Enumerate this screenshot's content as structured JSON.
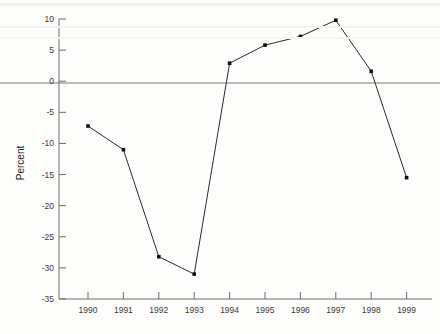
{
  "chart_data": {
    "type": "line",
    "title": "",
    "subtitle": "",
    "xlabel": "",
    "ylabel": "Percent",
    "categories": [
      "1990",
      "1991",
      "1992",
      "1993",
      "1994",
      "1995",
      "1996",
      "1997",
      "1998",
      "1999"
    ],
    "values": [
      -7.2,
      -11.0,
      -28.2,
      -31.0,
      2.9,
      5.8,
      7.2,
      9.8,
      1.6,
      -15.5
    ],
    "series": [
      {
        "name": "Percent",
        "values": [
          -7.2,
          -11.0,
          -28.2,
          -31.0,
          2.9,
          5.8,
          7.2,
          9.8,
          1.6,
          -15.5
        ]
      }
    ],
    "ylim": [
      -35,
      10
    ],
    "ytick_labels": [
      "10",
      "5",
      "0",
      "-5",
      "-10",
      "-15",
      "-20",
      "-25",
      "-30",
      "-35"
    ],
    "ytick_values": [
      10,
      5,
      0,
      -5,
      -10,
      -15,
      -20,
      -25,
      -30,
      -35
    ],
    "xtick_labels": [
      "1990",
      "1991",
      "1992",
      "1993",
      "1994",
      "1995",
      "1996",
      "1997",
      "1998",
      "1999"
    ],
    "grid": false,
    "zero_line": true,
    "legend": "none",
    "marker": "square",
    "colors": {
      "line": "#2a2a2a",
      "marker": "#101010",
      "axis": "#6e6e6e",
      "zero_line": "#7a7a7a",
      "text": "#3b3b3b",
      "background": "#fdfdfb"
    }
  }
}
